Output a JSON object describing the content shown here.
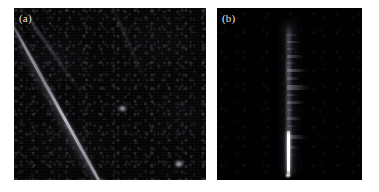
{
  "figure": {
    "background_color": "#ffffff",
    "width": 379,
    "height": 192,
    "panel_count": 2
  },
  "panels": [
    {
      "id": "panel-a",
      "label": "(a)",
      "label_color": "#e9e9e9",
      "background_color": "#040405",
      "kind": "fluorescence-micrograph",
      "description_visible": "",
      "bounds": {
        "x": 14,
        "y": 8,
        "width": 192,
        "height": 172
      },
      "features": {
        "main_filament": {
          "name": "diagonal-filament",
          "angle_deg": 61,
          "brightness": "bright",
          "color": "#bcbcc6"
        },
        "secondary_filament": {
          "name": "faint-upper-left-filament",
          "angle_deg": 55,
          "brightness": "faint",
          "color": "#84848f"
        },
        "tertiary_filament": {
          "name": "faint-upper-right-filament",
          "angle_deg": 66,
          "brightness": "very-faint",
          "color": "#7c7c87"
        }
      }
    },
    {
      "id": "panel-b",
      "label": "(b)",
      "label_color": "#e9e9e9",
      "background_color": "#010102",
      "kind": "kymograph",
      "description_visible": "",
      "bounds": {
        "x": 217,
        "y": 8,
        "width": 145,
        "height": 172
      },
      "features": {
        "vertical_track": {
          "name": "kymograph-vertical-track",
          "color": "#6e6e7a"
        },
        "bright_trace": {
          "name": "bright-white-trace",
          "color": "#ffffff",
          "top_px": 123,
          "height_px": 45
        }
      }
    }
  ],
  "chart_data": {
    "type": "heatmap",
    "title": "",
    "xlabel": "",
    "ylabel": "",
    "panels": [
      {
        "label": "(a)",
        "type": "image",
        "modality": "fluorescence micrograph",
        "colormap": "grayscale",
        "background_intensity": 0.02,
        "grid": false,
        "axis_visible": false,
        "tick_labels_x": [],
        "tick_labels_y": [],
        "annotations": [
          "(a)"
        ],
        "objects": [
          {
            "name": "main filament",
            "shape": "line",
            "angle_deg": 61,
            "peak_intensity": 0.78,
            "x0": 0.4,
            "y0": 0.0,
            "x1": 0.92,
            "y1": 1.0
          },
          {
            "name": "secondary filament",
            "shape": "line",
            "angle_deg": 55,
            "peak_intensity": 0.42,
            "x0": 0.03,
            "y0": 0.0,
            "x1": 0.4,
            "y1": 0.52
          },
          {
            "name": "tertiary filament",
            "shape": "line",
            "angle_deg": 66,
            "peak_intensity": 0.3,
            "x0": 0.5,
            "y0": 0.0,
            "x1": 0.74,
            "y1": 0.52
          }
        ]
      },
      {
        "label": "(b)",
        "type": "kymograph",
        "modality": "kymograph (position vs time)",
        "colormap": "grayscale",
        "background_intensity": 0.01,
        "grid": false,
        "axis_visible": false,
        "tick_labels_x": [],
        "tick_labels_y": [],
        "annotations": [
          "(b)"
        ],
        "objects": [
          {
            "name": "vertical track",
            "shape": "line",
            "x": 0.48,
            "y0": 0.1,
            "y1": 0.94,
            "peak_intensity": 0.48
          },
          {
            "name": "bright trace segment",
            "shape": "line",
            "x": 0.485,
            "y0": 0.72,
            "y1": 0.98,
            "peak_intensity": 1.0
          }
        ],
        "streaks": [
          {
            "y_frac": 0.055,
            "length_frac": 0.36,
            "intensity": 0.3,
            "thickness_px": 2
          },
          {
            "y_frac": 0.105,
            "length_frac": 0.44,
            "intensity": 0.45,
            "thickness_px": 2
          },
          {
            "y_frac": 0.15,
            "length_frac": 0.28,
            "intensity": 0.34,
            "thickness_px": 2
          },
          {
            "y_frac": 0.2,
            "length_frac": 0.52,
            "intensity": 0.5,
            "thickness_px": 3
          },
          {
            "y_frac": 0.25,
            "length_frac": 0.3,
            "intensity": 0.32,
            "thickness_px": 2
          },
          {
            "y_frac": 0.3,
            "length_frac": 0.66,
            "intensity": 0.58,
            "thickness_px": 3
          },
          {
            "y_frac": 0.355,
            "length_frac": 0.4,
            "intensity": 0.44,
            "thickness_px": 3
          },
          {
            "y_frac": 0.41,
            "length_frac": 0.72,
            "intensity": 0.62,
            "thickness_px": 5
          },
          {
            "y_frac": 0.47,
            "length_frac": 0.34,
            "intensity": 0.38,
            "thickness_px": 2
          },
          {
            "y_frac": 0.52,
            "length_frac": 0.56,
            "intensity": 0.52,
            "thickness_px": 3
          },
          {
            "y_frac": 0.575,
            "length_frac": 0.26,
            "intensity": 0.3,
            "thickness_px": 2
          },
          {
            "y_frac": 0.63,
            "length_frac": 0.46,
            "intensity": 0.46,
            "thickness_px": 3
          },
          {
            "y_frac": 0.69,
            "length_frac": 0.3,
            "intensity": 0.34,
            "thickness_px": 2
          },
          {
            "y_frac": 0.76,
            "length_frac": 0.62,
            "intensity": 0.56,
            "thickness_px": 4
          },
          {
            "y_frac": 0.83,
            "length_frac": 0.38,
            "intensity": 0.4,
            "thickness_px": 3
          },
          {
            "y_frac": 0.89,
            "length_frac": 0.24,
            "intensity": 0.28,
            "thickness_px": 2
          }
        ]
      }
    ]
  }
}
